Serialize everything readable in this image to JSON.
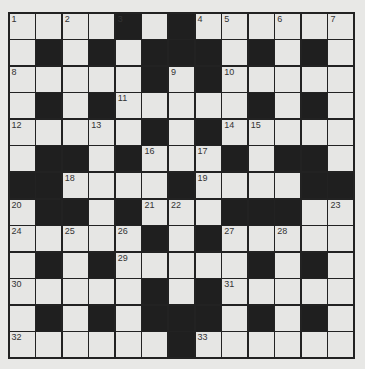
{
  "puzzle": {
    "size": 13,
    "colors": {
      "white": "#e6e6e4",
      "black": "#1f1f1f",
      "grid_line": "#222222",
      "background": "#e8e8e6"
    },
    "rows": [
      "....#.#......",
      ".#.#.###.#.#.",
      ".....#.#.....",
      ".#.#.....#.#.",
      ".....#.#.....",
      ".##.#...#.##.",
      "##....#....##",
      ".##.#...###..",
      ".....#.#.....",
      ".#.#.....#.#.",
      ".....#.#.....",
      ".#.#.###.#.#.",
      "......#......"
    ],
    "numbers": [
      {
        "r": 0,
        "c": 0,
        "n": "1"
      },
      {
        "r": 0,
        "c": 2,
        "n": "2"
      },
      {
        "r": 0,
        "c": 4,
        "n": "3"
      },
      {
        "r": 0,
        "c": 7,
        "n": "4"
      },
      {
        "r": 0,
        "c": 8,
        "n": "5"
      },
      {
        "r": 0,
        "c": 10,
        "n": "6"
      },
      {
        "r": 0,
        "c": 12,
        "n": "7"
      },
      {
        "r": 2,
        "c": 0,
        "n": "8"
      },
      {
        "r": 2,
        "c": 6,
        "n": "9"
      },
      {
        "r": 2,
        "c": 8,
        "n": "10"
      },
      {
        "r": 3,
        "c": 4,
        "n": "11"
      },
      {
        "r": 4,
        "c": 0,
        "n": "12"
      },
      {
        "r": 4,
        "c": 3,
        "n": "13"
      },
      {
        "r": 4,
        "c": 8,
        "n": "14"
      },
      {
        "r": 4,
        "c": 9,
        "n": "15"
      },
      {
        "r": 5,
        "c": 5,
        "n": "16"
      },
      {
        "r": 5,
        "c": 7,
        "n": "17"
      },
      {
        "r": 6,
        "c": 2,
        "n": "18"
      },
      {
        "r": 6,
        "c": 7,
        "n": "19"
      },
      {
        "r": 7,
        "c": 0,
        "n": "20"
      },
      {
        "r": 7,
        "c": 5,
        "n": "21"
      },
      {
        "r": 7,
        "c": 6,
        "n": "22"
      },
      {
        "r": 7,
        "c": 12,
        "n": "23"
      },
      {
        "r": 8,
        "c": 0,
        "n": "24"
      },
      {
        "r": 8,
        "c": 2,
        "n": "25"
      },
      {
        "r": 8,
        "c": 4,
        "n": "26"
      },
      {
        "r": 8,
        "c": 8,
        "n": "27"
      },
      {
        "r": 8,
        "c": 10,
        "n": "28"
      },
      {
        "r": 9,
        "c": 4,
        "n": "29"
      },
      {
        "r": 10,
        "c": 0,
        "n": "30"
      },
      {
        "r": 10,
        "c": 8,
        "n": "31"
      },
      {
        "r": 12,
        "c": 0,
        "n": "32"
      },
      {
        "r": 12,
        "c": 7,
        "n": "33"
      }
    ]
  }
}
